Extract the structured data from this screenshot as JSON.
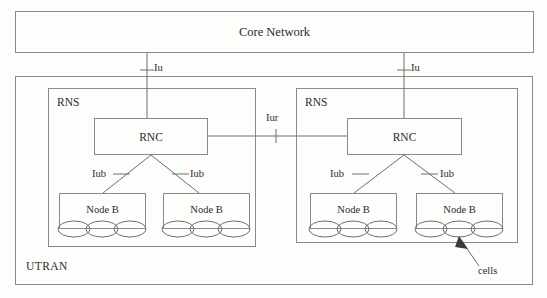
{
  "diagram": {
    "title_text": "UMTS UTRAN architecture",
    "core_network": {
      "label": "Core Network"
    },
    "utran": {
      "label": "UTRAN"
    },
    "rns": [
      {
        "label": "RNS",
        "rnc": {
          "label": "RNC"
        },
        "node_bs": [
          {
            "label": "Node B",
            "cells": 3
          },
          {
            "label": "Node B",
            "cells": 3
          }
        ]
      },
      {
        "label": "RNS",
        "rnc": {
          "label": "RNC"
        },
        "node_bs": [
          {
            "label": "Node B",
            "cells": 3
          },
          {
            "label": "Node B",
            "cells": 3
          }
        ]
      }
    ],
    "interfaces": {
      "iu_left": "Iu",
      "iu_right": "Iu",
      "iur": "Iur",
      "iub_1": "Iub",
      "iub_2": "Iub",
      "iub_3": "Iub",
      "iub_4": "Iub"
    },
    "annotations": {
      "cells": "cells"
    },
    "colors": {
      "background": "#fdfdfc",
      "stroke": "#8a8a8a",
      "line": "#6e6e6e",
      "text": "#2b2b2b"
    }
  }
}
